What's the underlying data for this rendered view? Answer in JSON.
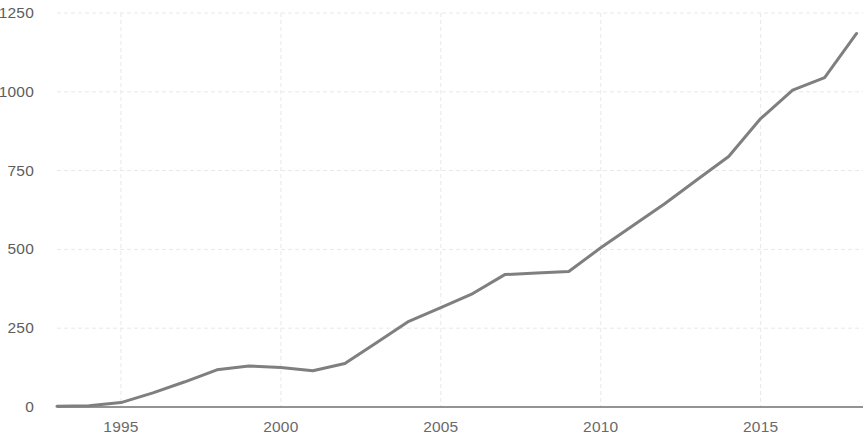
{
  "chart_data": {
    "type": "line",
    "title": "",
    "subtitle": "",
    "xlabel": "",
    "ylabel": "",
    "xlim": [
      1993,
      2018.2
    ],
    "ylim": [
      0,
      1250
    ],
    "grid": true,
    "legend": null,
    "series_color": "#7f7f7f",
    "grid_color": "#e8e8e8",
    "axis_line_color": "#8a8a8a",
    "tick_label_color": "#5d5d5d",
    "background_color": "#ffffff",
    "yticks": [
      0,
      250,
      500,
      750,
      1000,
      1250
    ],
    "ytick_labels": [
      "0",
      "250",
      "500",
      "750",
      "1000",
      "1250"
    ],
    "xticks": [
      1995,
      2000,
      2005,
      2010,
      2015
    ],
    "xtick_labels": [
      "1995",
      "2000",
      "2005",
      "2010",
      "2015"
    ],
    "series": [
      {
        "name": "series-1",
        "x": [
          1993,
          1994,
          1995,
          1996,
          1997,
          1998,
          1999,
          2000,
          2001,
          2002,
          2003,
          2004,
          2005,
          2006,
          2007,
          2008,
          2009,
          2010,
          2011,
          2012,
          2013,
          2014,
          2015,
          2016,
          2017,
          2018
        ],
        "values": [
          2,
          4,
          14,
          45,
          80,
          118,
          130,
          125,
          115,
          138,
          205,
          272,
          315,
          360,
          420,
          425,
          430,
          505,
          575,
          645,
          720,
          795,
          915,
          1005,
          1045,
          1185
        ]
      }
    ]
  }
}
